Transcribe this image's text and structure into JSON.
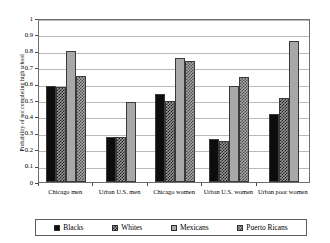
{
  "chart_data": {
    "type": "bar",
    "title": "",
    "xlabel": "",
    "ylabel": "Probability of not completing high school",
    "ylim": [
      0,
      1
    ],
    "ytick_labels": [
      "1",
      "0.9",
      "0.8",
      "0.7",
      "0.6",
      "0.5",
      "0.4",
      "0.3",
      "0.2",
      "0.1",
      "0"
    ],
    "ytick_values": [
      1,
      0.9,
      0.8,
      0.7,
      0.6,
      0.5,
      0.4,
      0.3,
      0.2,
      0.1,
      0
    ],
    "grid": true,
    "legend_position": "bottom",
    "categories": [
      "Chicago men",
      "Urban U.S. men",
      "Chicago women",
      "Urban U.S. women",
      "Urban poor women"
    ],
    "series": [
      {
        "name": "Blacks",
        "color": "#0d0d0d",
        "pattern": "solid-black",
        "values": [
          0.585,
          0.277,
          0.537,
          0.263,
          0.412
        ]
      },
      {
        "name": "Whites",
        "color": "#1c1c1c",
        "pattern": "dark-checker",
        "values": [
          0.578,
          0.277,
          0.495,
          0.248,
          0.513
        ]
      },
      {
        "name": "Mexicans",
        "color": "#a8a8a8",
        "pattern": "solid-lightgray",
        "values": [
          0.8,
          0.49,
          0.755,
          0.585,
          0.862
        ]
      },
      {
        "name": "Puerto Ricans",
        "color": "#4a4a4a",
        "pattern": "mid-checker",
        "values": [
          0.648,
          null,
          0.735,
          0.642,
          null
        ]
      }
    ]
  },
  "legend": {
    "items": [
      {
        "label": "Blacks"
      },
      {
        "label": "Whites"
      },
      {
        "label": "Mexicans"
      },
      {
        "label": "Puerto Ricans"
      }
    ]
  }
}
